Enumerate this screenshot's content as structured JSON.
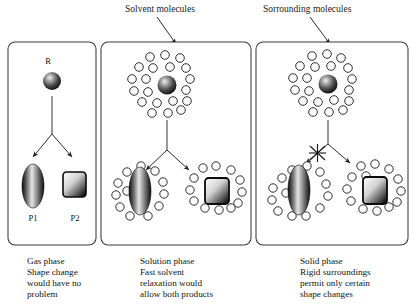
{
  "figure": {
    "title_annotations": [
      {
        "id": "solvent-molecules",
        "text": "Solvent molecules"
      },
      {
        "id": "surrounding-molecules",
        "text": "Sorrounding molecules"
      }
    ],
    "reactant_label": "R",
    "product_labels": {
      "p1": "P1",
      "p2": "P2"
    },
    "panels": [
      {
        "id": "gas-phase",
        "caption_lines": [
          "Gas phase",
          "Shape change",
          "would have no",
          "problem"
        ],
        "has_solvent_shell": false,
        "left_branch_blocked": false
      },
      {
        "id": "solution-phase",
        "caption_lines": [
          "Solution phase",
          "Fast solvent",
          "relaxation would",
          "allow both products"
        ],
        "has_solvent_shell": true,
        "left_branch_blocked": false
      },
      {
        "id": "solid-phase",
        "caption_lines": [
          "Solid phase",
          "Rigid surroundings",
          "permit only certain",
          "shape changes"
        ],
        "has_solvent_shell": true,
        "left_branch_blocked": true
      }
    ],
    "colors": {
      "background": "#ffffff",
      "stroke": "#2b2b2b",
      "panel_border": "#3a3a3a",
      "sphere_dark": "#141414",
      "sphere_highlight": "#e8e8e8",
      "text": "#141414"
    },
    "shapes": {
      "reactant": "sphere",
      "product_1": "ellipse",
      "product_2": "rounded-square"
    }
  }
}
